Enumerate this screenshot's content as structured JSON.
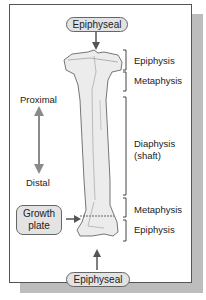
{
  "diagram": {
    "top_pill": "Epiphyseal",
    "bottom_pill": "Epiphyseal",
    "growth_plate": [
      "Growth",
      "plate"
    ],
    "direction": {
      "top": "Proximal",
      "bottom": "Distal"
    },
    "regions": [
      {
        "label": "Epiphysis"
      },
      {
        "label": "Metaphysis"
      },
      {
        "label": "Diaphysis",
        "sub": "(shaft)"
      },
      {
        "label": "Metaphysis"
      },
      {
        "label": "Epiphysis"
      }
    ],
    "colors": {
      "bone": "#ececec",
      "bone_outline": "#555555",
      "pill_fill": "#e3e3e3",
      "arrow": "#666666",
      "direction_arrow": "#8a8a8a",
      "shadow": "#bdbdbd"
    }
  }
}
